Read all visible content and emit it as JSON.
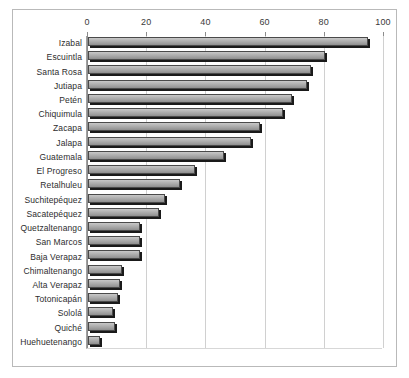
{
  "chart_data": {
    "type": "bar",
    "orientation": "horizontal",
    "title": "",
    "xlabel": "",
    "ylabel": "",
    "xlim": [
      0,
      100
    ],
    "xticks": [
      0,
      20,
      40,
      60,
      80,
      100
    ],
    "grid": true,
    "legend": null,
    "bar_color": "#b4b4b4",
    "bar_edge_color": "#4a4a4a",
    "categories": [
      "Izabal",
      "Escuintla",
      "Santa Rosa",
      "Jutiapa",
      "Petén",
      "Chiquimula",
      "Zacapa",
      "Jalapa",
      "Guatemala",
      "El Progreso",
      "Retalhuleu",
      "Suchitepéquez",
      "Sacatepéquez",
      "Quetzaltenango",
      "San Marcos",
      "Baja Verapaz",
      "Chimaltenango",
      "Alta Verapaz",
      "Totonicapán",
      "Sololá",
      "Quiché",
      "Huehuetenango"
    ],
    "values": [
      94.5,
      80,
      75.5,
      74,
      69,
      66,
      58,
      55,
      46,
      36,
      31,
      26,
      24,
      17.5,
      17.5,
      17.5,
      11.5,
      10.8,
      10.2,
      8.5,
      9,
      4
    ]
  }
}
